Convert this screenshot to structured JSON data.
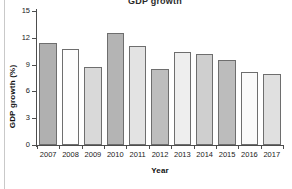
{
  "figure": {
    "clipped_title": "GDP growth",
    "background": "#ffffff"
  },
  "chart_data": {
    "type": "bar",
    "title": "",
    "xlabel": "Year",
    "ylabel": "GDP growth (%)",
    "categories": [
      "2007",
      "2008",
      "2009",
      "2010",
      "2011",
      "2012",
      "2013",
      "2014",
      "2015",
      "2016",
      "2017"
    ],
    "values": [
      11.4,
      10.8,
      8.7,
      12.5,
      11.1,
      8.5,
      10.4,
      10.2,
      9.5,
      8.2,
      8.0
    ],
    "bar_colors": [
      "#b0b0b0",
      "#fdfdfd",
      "#d9d9d9",
      "#b4b4b4",
      "#e3e3e3",
      "#bdbdbd",
      "#eeeeee",
      "#cfcfcf",
      "#bcbcbc",
      "#fafafa",
      "#e0e0e0"
    ],
    "bar_edge_color": "#6e6e6e",
    "ylim": [
      0,
      15
    ],
    "yticks": [
      0,
      3,
      6,
      9,
      12,
      15
    ],
    "ytick_labels": [
      "0",
      "3",
      "6",
      "9",
      "12",
      "15"
    ],
    "grid": false,
    "legend": "none",
    "axis_color": "#4d4d4d"
  }
}
